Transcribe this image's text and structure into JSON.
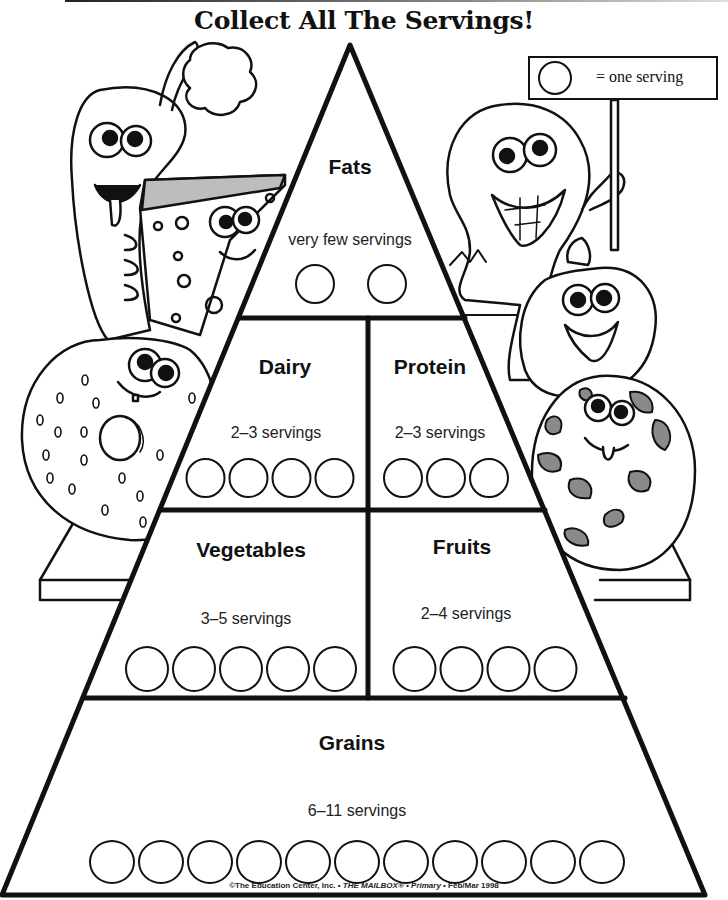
{
  "title": "Collect All The Servings!",
  "legend": {
    "icon": "circle-icon",
    "text": "= one serving"
  },
  "tiers": {
    "fats": {
      "name": "Fats",
      "count_label": "very few servings",
      "circles": 2
    },
    "dairy": {
      "name": "Dairy",
      "count_label": "2–3 servings",
      "circles": 4
    },
    "protein": {
      "name": "Protein",
      "count_label": "2–3 servings",
      "circles": 3
    },
    "vegetables": {
      "name": "Vegetables",
      "count_label": "3–5 servings",
      "circles": 5
    },
    "fruits": {
      "name": "Fruits",
      "count_label": "2–4 servings",
      "circles": 4
    },
    "grains": {
      "name": "Grains",
      "count_label": "6–11 servings",
      "circles": 11
    }
  },
  "characters": [
    {
      "name": "carrot",
      "icon": "carrot-character-icon"
    },
    {
      "name": "cheese",
      "icon": "cheese-character-icon"
    },
    {
      "name": "bagel",
      "icon": "bagel-character-icon"
    },
    {
      "name": "peanut",
      "icon": "peanut-character-icon"
    },
    {
      "name": "apple",
      "icon": "apple-character-icon"
    },
    {
      "name": "cookie",
      "icon": "cookie-character-icon"
    }
  ],
  "footer": {
    "publisher": "©The Education Center, Inc. • ",
    "magazine": "THE MAILBOX® • Primary",
    "issue": " • Feb/Mar 1998"
  },
  "colors": {
    "ink": "#111111",
    "chip_gray": "#8a8a8a",
    "cheese_top": "#bdbdbd",
    "paper": "#ffffff"
  }
}
